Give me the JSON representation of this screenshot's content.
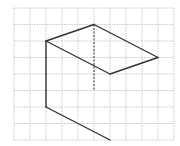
{
  "diagram": {
    "type": "isometric-grid-figure",
    "grid": {
      "x_lines": [
        14,
        30,
        46,
        62,
        78,
        94,
        110,
        126,
        142,
        158,
        174
      ],
      "y_lines": [
        8,
        24.5,
        41,
        57.5,
        74,
        90.5,
        107,
        123.5,
        140
      ],
      "color": "#bdbdbd"
    },
    "stroke_color": "#333333",
    "solid_edges": [
      {
        "x1": 46,
        "y1": 41,
        "x2": 94,
        "y2": 24.5
      },
      {
        "x1": 94,
        "y1": 24.5,
        "x2": 158,
        "y2": 57.5
      },
      {
        "x1": 158,
        "y1": 57.5,
        "x2": 110,
        "y2": 74
      },
      {
        "x1": 110,
        "y1": 74,
        "x2": 46,
        "y2": 41
      },
      {
        "x1": 46,
        "y1": 41,
        "x2": 46,
        "y2": 107
      },
      {
        "x1": 46,
        "y1": 107,
        "x2": 110,
        "y2": 140
      }
    ],
    "dashed_edges": [
      {
        "x1": 94,
        "y1": 24.5,
        "x2": 94,
        "y2": 90.5
      }
    ]
  }
}
